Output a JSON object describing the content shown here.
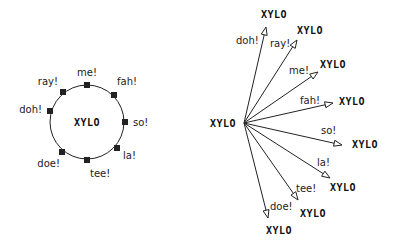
{
  "ring_diagram": {
    "center_label": "XYLO",
    "center": [
      87,
      122
    ],
    "radius": 37,
    "nodes": [
      {
        "label": "me!",
        "square": [
          87,
          85
        ],
        "text": [
          87,
          76
        ],
        "anchor": "middle"
      },
      {
        "label": "fah!",
        "square": [
          114,
          95
        ],
        "text": [
          117,
          85
        ],
        "anchor": "start"
      },
      {
        "label": "so!",
        "square": [
          125,
          122
        ],
        "text": [
          133,
          126
        ],
        "anchor": "start"
      },
      {
        "label": "la!",
        "square": [
          117,
          148
        ],
        "text": [
          123,
          159
        ],
        "anchor": "start"
      },
      {
        "label": "tee!",
        "square": [
          87,
          160
        ],
        "text": [
          90,
          177
        ],
        "anchor": "start"
      },
      {
        "label": "doe!",
        "square": [
          62,
          152
        ],
        "text": [
          60,
          167
        ],
        "anchor": "end"
      },
      {
        "label": "doh!",
        "square": [
          50,
          111
        ],
        "text": [
          42,
          113
        ],
        "anchor": "end"
      },
      {
        "label": "ray!",
        "square": [
          63,
          92
        ],
        "text": [
          58,
          85
        ],
        "anchor": "end"
      }
    ]
  },
  "star_diagram": {
    "hub_label": "XYLO",
    "hub": [
      244,
      123
    ],
    "hub_text": [
      223,
      127
    ],
    "arrows": [
      {
        "label": "doh!",
        "tip": [
          266,
          27
        ],
        "label_pos": [
          236,
          44
        ],
        "node_label": "XYLO",
        "node_pos": [
          261,
          18
        ]
      },
      {
        "label": "ray!",
        "tip": [
          297,
          40
        ],
        "label_pos": [
          270,
          47
        ],
        "node_label": "XYLO",
        "node_pos": [
          297,
          34
        ]
      },
      {
        "label": "me!",
        "tip": [
          318,
          72
        ],
        "label_pos": [
          289,
          74
        ],
        "node_label": "XYLO",
        "node_pos": [
          320,
          68
        ]
      },
      {
        "label": "fah!",
        "tip": [
          333,
          103
        ],
        "label_pos": [
          300,
          104
        ],
        "node_label": "XYLO",
        "node_pos": [
          339,
          105
        ]
      },
      {
        "label": "so!",
        "tip": [
          342,
          145
        ],
        "label_pos": [
          321,
          134
        ],
        "node_label": "XYLO",
        "node_pos": [
          352,
          148
        ]
      },
      {
        "label": "la!",
        "tip": [
          330,
          178
        ],
        "label_pos": [
          317,
          166
        ],
        "node_label": "XYLO",
        "node_pos": [
          330,
          191
        ]
      },
      {
        "label": "tee!",
        "tip": [
          298,
          200
        ],
        "label_pos": [
          296,
          192
        ],
        "node_label": "XYLO",
        "node_pos": [
          300,
          217
        ]
      },
      {
        "label": "doe!",
        "tip": [
          268,
          218
        ],
        "label_pos": [
          270,
          210
        ],
        "node_label": "XYLO",
        "node_pos": [
          266,
          234
        ]
      }
    ]
  },
  "colors": {
    "stroke": "#222222",
    "text": "#222222",
    "background": "#ffffff"
  }
}
